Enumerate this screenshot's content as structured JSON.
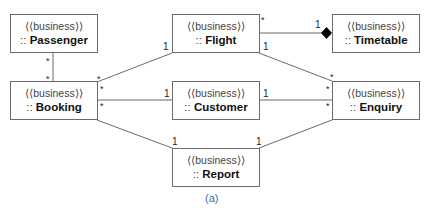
{
  "diagram": {
    "stereotype": "⟨⟨business⟩⟩",
    "prefix": ":: ",
    "classes": {
      "passenger": "Passenger",
      "flight": "Flight",
      "timetable": "Timetable",
      "booking": "Booking",
      "customer": "Customer",
      "enquiry": "Enquiry",
      "report": "Report"
    },
    "associations": [
      {
        "from": "Passenger",
        "to": "Booking",
        "from_mult": "*",
        "to_mult": "*"
      },
      {
        "from": "Booking",
        "to": "Flight",
        "from_mult": "*",
        "to_mult": "1"
      },
      {
        "from": "Booking",
        "to": "Customer",
        "from_mult": "*",
        "to_mult": "1"
      },
      {
        "from": "Booking",
        "to": "Report",
        "from_mult": "*",
        "to_mult": "1"
      },
      {
        "from": "Flight",
        "to": "Timetable",
        "from_mult": "*",
        "to_mult": "1",
        "kind": "composition"
      },
      {
        "from": "Flight",
        "to": "Enquiry",
        "from_mult": "1",
        "to_mult": "*"
      },
      {
        "from": "Customer",
        "to": "Enquiry",
        "from_mult": "1",
        "to_mult": "*"
      },
      {
        "from": "Report",
        "to": "Enquiry",
        "from_mult": "1",
        "to_mult": "*"
      }
    ],
    "multiplicities": {
      "star": "*",
      "one": "1"
    },
    "caption": "(a)",
    "colors": {
      "line": "#6b6b6b",
      "caption": "#3a6ea5"
    }
  }
}
